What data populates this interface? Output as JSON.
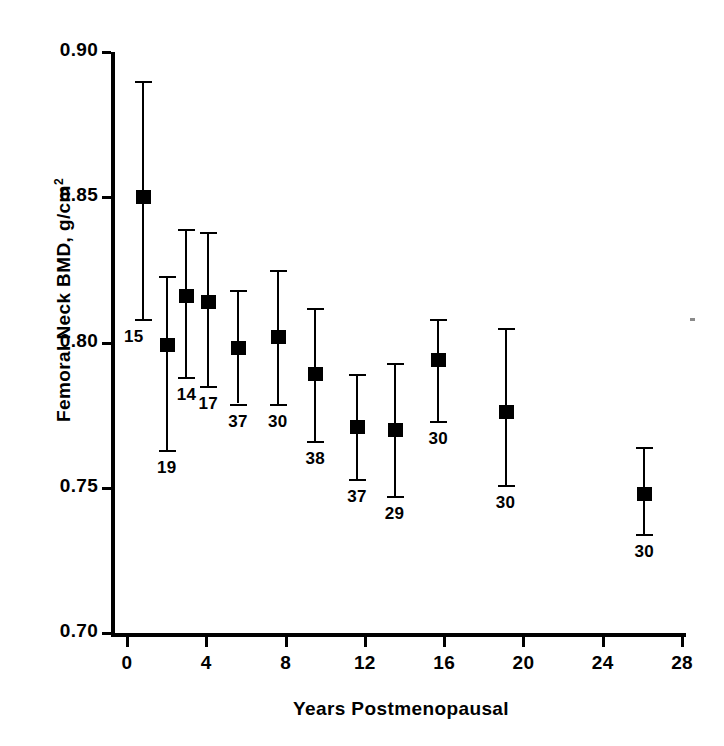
{
  "chart_data": {
    "type": "scatter",
    "title": "",
    "xlabel": "Years Postmenopausal",
    "ylabel": "Femoral Neck BMD, g/cm²",
    "ylabel_text": "Femoral Neck BMD, g/cm",
    "ylabel_sup": "2",
    "xlim": [
      -1.0,
      28.0
    ],
    "ylim": [
      0.7,
      0.9
    ],
    "xticks": [
      0,
      4,
      8,
      12,
      16,
      20,
      24,
      28
    ],
    "xtick_labels": [
      "0",
      "4",
      "8",
      "12",
      "16",
      "20",
      "24",
      "28"
    ],
    "yticks": [
      0.7,
      0.75,
      0.8,
      0.85,
      0.9
    ],
    "ytick_labels": [
      "0.70",
      "0.75",
      "0.80",
      "0.85",
      "0.90"
    ],
    "grid": false,
    "legend": null,
    "error_type": "mean ± SD",
    "marker_style": "filled-square",
    "annotation_meaning": "group sample size (n) printed below each error bar",
    "points": [
      {
        "x": 0.8,
        "y": 0.85,
        "y_low": 0.808,
        "y_high": 0.89,
        "n": "15",
        "n_side": "left"
      },
      {
        "x": 2.0,
        "y": 0.799,
        "y_low": 0.763,
        "y_high": 0.823,
        "n": "19",
        "n_side": "center"
      },
      {
        "x": 3.0,
        "y": 0.816,
        "y_low": 0.788,
        "y_high": 0.839,
        "n": "14",
        "n_side": "center"
      },
      {
        "x": 4.1,
        "y": 0.814,
        "y_low": 0.785,
        "y_high": 0.838,
        "n": "17",
        "n_side": "center"
      },
      {
        "x": 5.6,
        "y": 0.798,
        "y_low": 0.779,
        "y_high": 0.818,
        "n": "37",
        "n_side": "center"
      },
      {
        "x": 7.6,
        "y": 0.802,
        "y_low": 0.779,
        "y_high": 0.825,
        "n": "30",
        "n_side": "center"
      },
      {
        "x": 9.5,
        "y": 0.789,
        "y_low": 0.766,
        "y_high": 0.812,
        "n": "38",
        "n_side": "center"
      },
      {
        "x": 11.6,
        "y": 0.771,
        "y_low": 0.753,
        "y_high": 0.789,
        "n": "37",
        "n_side": "center"
      },
      {
        "x": 13.5,
        "y": 0.77,
        "y_low": 0.747,
        "y_high": 0.793,
        "n": "29",
        "n_side": "center"
      },
      {
        "x": 15.7,
        "y": 0.794,
        "y_low": 0.773,
        "y_high": 0.808,
        "n": "30",
        "n_side": "center"
      },
      {
        "x": 19.1,
        "y": 0.776,
        "y_low": 0.751,
        "y_high": 0.805,
        "n": "30",
        "n_side": "center"
      },
      {
        "x": 26.1,
        "y": 0.748,
        "y_low": 0.734,
        "y_high": 0.764,
        "n": "30",
        "n_side": "center"
      }
    ],
    "colors": {
      "axis": "#000000",
      "marker": "#000000",
      "errorbar": "#000000",
      "background": "#ffffff"
    }
  }
}
